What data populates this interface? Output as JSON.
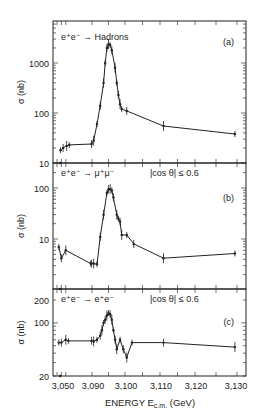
{
  "figure": {
    "xlabel": "ENERGY E",
    "xlabel_sub": "c.m.",
    "xlabel_unit": "(GeV)",
    "x_tick_labels": [
      "3,050",
      "3,090",
      "3,100",
      "3,110",
      "3,120",
      "3,130"
    ],
    "ylabel": "σ (nb)"
  },
  "chart_data": [
    {
      "type": "scatter",
      "panel": "(a)",
      "title": "e⁺e⁻ → Hadrons",
      "annotation": "",
      "xlabel": "ENERGY E_c.m. (GeV)",
      "ylabel": "σ (nb)",
      "yscale": "log",
      "ylim": [
        10,
        5000
      ],
      "y_tick_labels": [
        "10",
        "100",
        "1000"
      ],
      "xlim": [
        3.05,
        3.132
      ],
      "x": [
        3.054,
        3.057,
        3.061,
        3.064,
        3.0895,
        3.0905,
        3.0915,
        3.0925,
        3.0935,
        3.094,
        3.0945,
        3.095,
        3.0955,
        3.096,
        3.097,
        3.0975,
        3.098,
        3.0985,
        3.099,
        3.1005,
        3.111,
        3.1295
      ],
      "values": [
        18,
        20,
        22,
        23,
        24,
        28,
        60,
        140,
        400,
        1000,
        2000,
        2400,
        2300,
        1800,
        800,
        400,
        230,
        150,
        120,
        110,
        55,
        38
      ],
      "fit_curve": true
    },
    {
      "type": "scatter",
      "panel": "(b)",
      "title": "e⁺e⁻ → μ⁺μ⁻",
      "annotation": "|cos θ| ≤ 0.6",
      "xlabel": "ENERGY E_c.m. (GeV)",
      "ylabel": "σ (nb)",
      "yscale": "log",
      "ylim": [
        1,
        200
      ],
      "y_tick_labels": [
        "10",
        "100"
      ],
      "xlim": [
        3.05,
        3.132
      ],
      "x": [
        3.052,
        3.055,
        3.06,
        3.0885,
        3.0895,
        3.0905,
        3.0915,
        3.0925,
        3.0935,
        3.0945,
        3.095,
        3.0955,
        3.096,
        3.0965,
        3.0975,
        3.098,
        3.0985,
        3.099,
        3.1005,
        3.1025,
        3.111,
        3.1295
      ],
      "values": [
        7,
        4.2,
        6,
        3.3,
        3.3,
        3.3,
        3.2,
        11,
        30,
        80,
        95,
        95,
        90,
        65,
        30,
        25,
        22,
        12,
        12,
        8,
        4.2,
        5.2
      ],
      "fit_curve": true
    },
    {
      "type": "scatter",
      "panel": "(c)",
      "title": "e⁺e⁻ → e⁺e⁻",
      "annotation": "|cos θ| ≤ 0.6",
      "xlabel": "ENERGY E_c.m. (GeV)",
      "ylabel": "σ (nb)",
      "yscale": "log",
      "ylim": [
        20,
        250
      ],
      "y_tick_labels": [
        "20",
        "100",
        "200"
      ],
      "xlim": [
        3.05,
        3.132
      ],
      "x": [
        3.052,
        3.055,
        3.06,
        3.063,
        3.0895,
        3.0905,
        3.0915,
        3.0925,
        3.093,
        3.0935,
        3.094,
        3.0945,
        3.095,
        3.0955,
        3.096,
        3.0965,
        3.097,
        3.0975,
        3.0985,
        3.0995,
        3.1005,
        3.102,
        3.111,
        3.1295
      ],
      "values": [
        55,
        55,
        60,
        58,
        58,
        57,
        60,
        68,
        80,
        100,
        110,
        125,
        135,
        130,
        110,
        80,
        60,
        45,
        60,
        45,
        35,
        55,
        55,
        48
      ],
      "fit_curve": true
    }
  ]
}
